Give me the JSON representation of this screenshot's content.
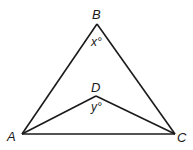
{
  "diagram": {
    "type": "geometry-triangle",
    "vertices": {
      "A": {
        "label": "A",
        "x": 22,
        "y": 134
      },
      "B": {
        "label": "B",
        "x": 97,
        "y": 24
      },
      "C": {
        "label": "C",
        "x": 175,
        "y": 134
      },
      "D": {
        "label": "D",
        "x": 96,
        "y": 96
      }
    },
    "angles": {
      "B": {
        "label": "x°"
      },
      "D": {
        "label": "y°"
      }
    },
    "segments": [
      "AB",
      "BC",
      "AC",
      "AD",
      "DC"
    ],
    "stroke_color": "#1a1a1a"
  }
}
